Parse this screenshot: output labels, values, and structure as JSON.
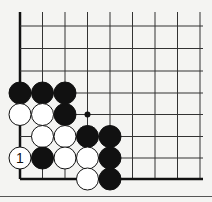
{
  "diagram": {
    "type": "go-board-corner",
    "columns_x": [
      20,
      42.5,
      65,
      87.5,
      110,
      132.5,
      155,
      177.5,
      200
    ],
    "rows_y": [
      26,
      48.5,
      71,
      93,
      114.5,
      136.5,
      158,
      179
    ],
    "top_open_y": 12,
    "right_open_x": 203,
    "stone_radius": 11,
    "colors": {
      "line": "#333333",
      "edge": "#111111",
      "black": "#111111",
      "white": "#ffffff",
      "background": "#f4f4f2"
    },
    "stones": [
      {
        "col": 0,
        "row": 3,
        "color": "black"
      },
      {
        "col": 1,
        "row": 3,
        "color": "black"
      },
      {
        "col": 2,
        "row": 3,
        "color": "black"
      },
      {
        "col": 0,
        "row": 4,
        "color": "white"
      },
      {
        "col": 1,
        "row": 4,
        "color": "white"
      },
      {
        "col": 2,
        "row": 4,
        "color": "black"
      },
      {
        "col": 1,
        "row": 5,
        "color": "white"
      },
      {
        "col": 2,
        "row": 5,
        "color": "white"
      },
      {
        "col": 3,
        "row": 5,
        "color": "black"
      },
      {
        "col": 4,
        "row": 5,
        "color": "black"
      },
      {
        "col": 0,
        "row": 6,
        "color": "white",
        "label": "1"
      },
      {
        "col": 1,
        "row": 6,
        "color": "black"
      },
      {
        "col": 2,
        "row": 6,
        "color": "white"
      },
      {
        "col": 3,
        "row": 6,
        "color": "white"
      },
      {
        "col": 4,
        "row": 6,
        "color": "black"
      },
      {
        "col": 3,
        "row": 7,
        "color": "white"
      },
      {
        "col": 4,
        "row": 7,
        "color": "black"
      }
    ],
    "markers": [
      {
        "col": 3,
        "row": 4,
        "type": "dot"
      }
    ]
  }
}
